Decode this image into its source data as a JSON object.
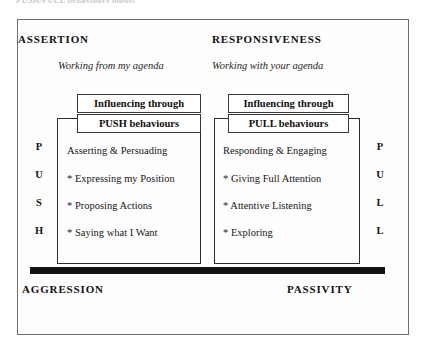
{
  "caption": {
    "clipped_line": "PUSH/PULL behaviours model"
  },
  "diagram": {
    "poles": {
      "top_left": "ASSERTION",
      "top_right": "RESPONSIVENESS",
      "bottom_left": "AGGRESSION",
      "bottom_right": "PASSIVITY"
    },
    "agenda": {
      "left": "Working from my agenda",
      "right": "Working with your agenda"
    },
    "axis_labels": {
      "left_letters": [
        "P",
        "U",
        "S",
        "H"
      ],
      "right_letters": [
        "P",
        "U",
        "L",
        "L"
      ]
    },
    "columns": [
      {
        "header_top": "Influencing through",
        "header_bottom": "PUSH behaviours",
        "lead": "Asserting & Persuading",
        "items": [
          "* Expressing my Position",
          "* Proposing Actions",
          "* Saying what I Want"
        ]
      },
      {
        "header_top": "Influencing through",
        "header_bottom": "PULL behaviours",
        "lead": "Responding & Engaging",
        "items": [
          "* Giving Full Attention",
          "* Attentive Listening",
          "* Exploring"
        ]
      }
    ],
    "colors": {
      "frame": "#6e6e75",
      "column_border": "#2b2b2b",
      "header_border": "#3a3a3a",
      "divider_bar": "#131313",
      "text": "#161616",
      "background": "#ffffff"
    }
  }
}
